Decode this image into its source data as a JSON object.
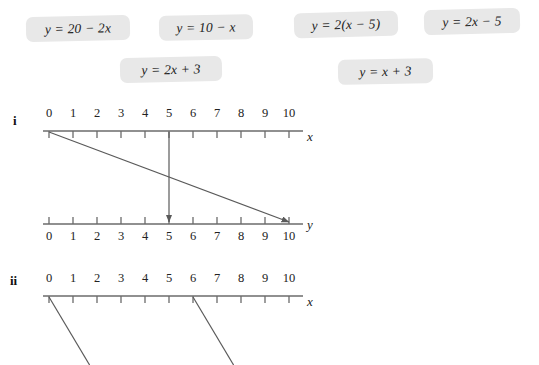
{
  "equations": [
    {
      "id": "eq-1",
      "text": "y = 20 − 2x",
      "left": 26,
      "top": 16,
      "width": 104,
      "height": 25,
      "rotate": -1.2
    },
    {
      "id": "eq-2",
      "text": "y = 10 − x",
      "left": 159,
      "top": 15,
      "width": 94,
      "height": 25,
      "rotate": -1.0
    },
    {
      "id": "eq-3",
      "text": "y = 2(x − 5)",
      "left": 294,
      "top": 12,
      "width": 104,
      "height": 25,
      "rotate": -1.5
    },
    {
      "id": "eq-4",
      "text": "y = 2x − 5",
      "left": 424,
      "top": 9,
      "width": 96,
      "height": 25,
      "rotate": -1.5
    },
    {
      "id": "eq-5",
      "text": "y = 2x + 3",
      "left": 120,
      "top": 57,
      "width": 102,
      "height": 25,
      "rotate": -1.2
    },
    {
      "id": "eq-6",
      "text": "y = x + 3",
      "left": 338,
      "top": 59,
      "width": 95,
      "height": 25,
      "rotate": -1.2
    }
  ],
  "diagrams": [
    {
      "id": "diagram-i",
      "roman": "i",
      "axes": [
        {
          "id": "axis-i-x",
          "name": "x",
          "labels_position": "above",
          "tick_labels": [
            "0",
            "1",
            "2",
            "3",
            "4",
            "5",
            "6",
            "7",
            "8",
            "9",
            "10"
          ]
        },
        {
          "id": "axis-i-y",
          "name": "y",
          "labels_position": "below",
          "tick_labels": [
            "0",
            "1",
            "2",
            "3",
            "4",
            "5",
            "6",
            "7",
            "8",
            "9",
            "10"
          ]
        }
      ],
      "mappings": [
        {
          "id": "mapping-i-a",
          "from": 0,
          "to": 10,
          "arrow": true
        },
        {
          "id": "mapping-i-b",
          "from": 5,
          "to": 5,
          "arrow": true
        }
      ]
    },
    {
      "id": "diagram-ii",
      "roman": "ii",
      "axes": [
        {
          "id": "axis-ii-x",
          "name": "x",
          "labels_position": "above",
          "tick_labels": [
            "0",
            "1",
            "2",
            "3",
            "4",
            "5",
            "6",
            "7",
            "8",
            "9",
            "10"
          ]
        }
      ],
      "mappings": [
        {
          "id": "mapping-ii-a",
          "from": 0,
          "arrow": false
        },
        {
          "id": "mapping-ii-b",
          "from": 6,
          "arrow": false
        }
      ]
    }
  ],
  "geometry": {
    "origin_x": 49,
    "unit_px": 24,
    "axis_i_x_y": 131,
    "axis_i_y_y": 224,
    "axis_ii_x_y": 296,
    "tick_len": 7,
    "axis_extend": 14
  },
  "colors": {
    "chip_bg": "#e8e8e8",
    "ink": "#222222",
    "line": "#5a5a5a",
    "axis": "#6b6b6b"
  },
  "chart_data": {
    "type": "line",
    "title": "",
    "xlabel": "x",
    "ylabel": "y",
    "xlim": [
      0,
      10
    ],
    "ylim": [
      0,
      10
    ],
    "grid": false,
    "legend": "none",
    "series": [
      {
        "name": "diagram-i",
        "kind": "mapping-arrows",
        "points": [
          {
            "x": 0,
            "y": 10
          },
          {
            "x": 5,
            "y": 5
          }
        ]
      },
      {
        "name": "diagram-ii",
        "kind": "mapping-arrows-truncated",
        "points": [
          {
            "x": 0,
            "y": null
          },
          {
            "x": 6,
            "y": null
          }
        ]
      }
    ],
    "candidate_equations": [
      "y = 20 − 2x",
      "y = 10 − x",
      "y = 2(x − 5)",
      "y = 2x − 5",
      "y = 2x + 3",
      "y = x + 3"
    ]
  }
}
